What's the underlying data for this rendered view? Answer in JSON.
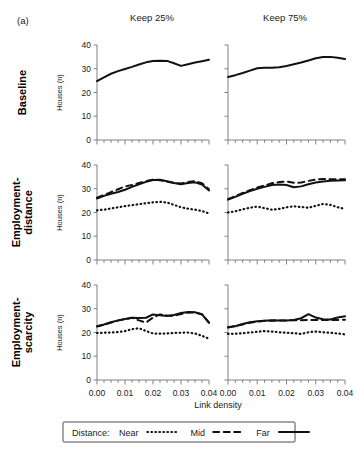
{
  "figure": {
    "panel_letter": "(a)",
    "column_titles": [
      "Keep 25%",
      "Keep 75%"
    ],
    "row_titles": [
      "Baseline",
      "Employment-\ndistance",
      "Employment-\nscarcity"
    ],
    "row_titles_flat": [
      "Baseline",
      "Employment-distance",
      "Employment-scarcity"
    ],
    "y_axis_label": "Houses (n)",
    "x_axis_label": "Link density",
    "legend": {
      "prefix": "Distance:",
      "entries": [
        {
          "label": "Near",
          "style": "dotted"
        },
        {
          "label": "Mid",
          "style": "dashed"
        },
        {
          "label": "Far",
          "style": "solid"
        }
      ]
    }
  },
  "chart_data": {
    "type": "line",
    "title": "",
    "xlabel": "Link density",
    "ylabel": "Houses (n)",
    "xlim": [
      0.0,
      0.04
    ],
    "ylim": [
      0,
      40
    ],
    "xticks": [
      0.0,
      0.01,
      0.02,
      0.03,
      0.04
    ],
    "xticklabels": [
      "0.00",
      "0.01",
      "0.02",
      "0.03",
      "0.04"
    ],
    "yticks": [
      0,
      10,
      20,
      30,
      40
    ],
    "yticklabels": [
      "0",
      "10",
      "20",
      "30",
      "40"
    ],
    "grid": false,
    "legend_position": "bottom",
    "x": [
      0.0,
      0.0025,
      0.005,
      0.0075,
      0.01,
      0.0125,
      0.015,
      0.0175,
      0.02,
      0.0225,
      0.025,
      0.0275,
      0.03,
      0.0325,
      0.035,
      0.0375,
      0.04
    ],
    "panels": [
      {
        "row": "Baseline",
        "column": "Keep 25%",
        "series": [
          {
            "name": "Far",
            "style": "solid",
            "values": [
              24.8,
              26.4,
              27.9,
              29.0,
              29.9,
              30.8,
              31.8,
              32.7,
              33.3,
              33.4,
              33.3,
              32.3,
              31.2,
              31.9,
              32.6,
              33.2,
              33.8
            ]
          }
        ]
      },
      {
        "row": "Baseline",
        "column": "Keep 75%",
        "series": [
          {
            "name": "Far",
            "style": "solid",
            "values": [
              26.5,
              27.3,
              28.2,
              29.2,
              30.2,
              30.4,
              30.4,
              30.6,
              31.2,
              31.9,
              32.6,
              33.5,
              34.4,
              34.9,
              35.0,
              34.6,
              34.1
            ]
          }
        ]
      },
      {
        "row": "Employment-distance",
        "column": "Keep 25%",
        "series": [
          {
            "name": "Near",
            "style": "dotted",
            "values": [
              20.9,
              21.2,
              21.7,
              22.2,
              22.7,
              23.1,
              23.5,
              23.9,
              24.3,
              24.5,
              24.2,
              23.2,
              22.2,
              21.6,
              21.2,
              20.6,
              19.6
            ]
          },
          {
            "name": "Mid",
            "style": "dashed",
            "values": [
              26.2,
              27.4,
              28.6,
              29.8,
              31.0,
              31.6,
              32.4,
              33.2,
              33.9,
              33.6,
              33.0,
              32.5,
              32.2,
              32.8,
              33.2,
              32.3,
              29.8
            ]
          },
          {
            "name": "Far",
            "style": "solid",
            "values": [
              25.9,
              27.0,
              27.9,
              28.6,
              29.6,
              30.8,
              31.9,
              32.9,
              33.7,
              33.8,
              33.2,
              32.4,
              31.9,
              32.4,
              32.7,
              31.8,
              29.3
            ]
          }
        ]
      },
      {
        "row": "Employment-distance",
        "column": "Keep 75%",
        "series": [
          {
            "name": "Near",
            "style": "dotted",
            "values": [
              20.0,
              20.5,
              21.3,
              22.0,
              22.5,
              21.8,
              21.2,
              21.5,
              22.2,
              22.6,
              22.3,
              22.0,
              22.8,
              23.6,
              23.2,
              22.2,
              21.5
            ]
          },
          {
            "name": "Mid",
            "style": "dashed",
            "values": [
              25.6,
              26.9,
              28.2,
              29.4,
              30.5,
              31.4,
              32.3,
              32.8,
              33.1,
              32.5,
              32.6,
              33.3,
              33.9,
              34.1,
              34.0,
              34.0,
              34.0
            ]
          },
          {
            "name": "Far",
            "style": "solid",
            "values": [
              25.4,
              26.6,
              27.9,
              29.0,
              30.0,
              30.8,
              31.6,
              31.8,
              31.6,
              30.6,
              31.0,
              31.9,
              32.6,
              33.1,
              33.4,
              33.5,
              33.6
            ]
          }
        ]
      },
      {
        "row": "Employment-scarcity",
        "column": "Keep 25%",
        "series": [
          {
            "name": "Near",
            "style": "dotted",
            "values": [
              19.8,
              19.9,
              20.0,
              20.2,
              20.6,
              21.4,
              21.8,
              20.6,
              19.6,
              19.5,
              19.6,
              19.8,
              19.9,
              20.0,
              19.6,
              18.6,
              17.4
            ]
          },
          {
            "name": "Mid",
            "style": "dashed",
            "values": [
              22.5,
              23.3,
              24.2,
              25.0,
              25.6,
              26.2,
              25.1,
              24.2,
              26.3,
              27.6,
              27.2,
              27.0,
              27.8,
              28.4,
              28.5,
              27.7,
              24.2
            ]
          },
          {
            "name": "Far",
            "style": "solid",
            "values": [
              22.6,
              23.4,
              24.3,
              25.1,
              25.7,
              26.2,
              26.1,
              26.2,
              27.6,
              27.3,
              26.9,
              27.4,
              28.2,
              28.6,
              28.5,
              27.6,
              24.1
            ]
          }
        ]
      },
      {
        "row": "Employment-scarcity",
        "column": "Keep 75%",
        "series": [
          {
            "name": "Near",
            "style": "dotted",
            "values": [
              19.4,
              19.5,
              19.7,
              20.0,
              20.3,
              20.6,
              20.4,
              20.1,
              19.9,
              19.7,
              19.4,
              20.1,
              20.4,
              20.1,
              19.9,
              19.6,
              19.2
            ]
          },
          {
            "name": "Mid",
            "style": "dashed",
            "values": [
              22.2,
              22.8,
              23.4,
              24.1,
              24.6,
              24.9,
              25.0,
              25.1,
              25.1,
              25.2,
              25.2,
              25.3,
              25.3,
              25.3,
              25.2,
              25.3,
              25.4
            ]
          },
          {
            "name": "Far",
            "style": "solid",
            "values": [
              22.1,
              22.6,
              23.6,
              24.3,
              24.7,
              25.0,
              25.2,
              25.1,
              25.1,
              25.3,
              26.0,
              27.7,
              26.3,
              25.6,
              25.5,
              26.3,
              26.8
            ]
          }
        ]
      }
    ]
  }
}
